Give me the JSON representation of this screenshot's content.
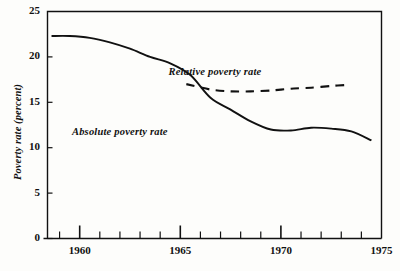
{
  "chart_data": {
    "type": "line",
    "title": "",
    "xlabel": "",
    "ylabel": "Poverty rate (percent)",
    "xlim": [
      1958.4,
      1975.0
    ],
    "ylim": [
      0,
      25
    ],
    "grid": false,
    "legend_position": "inline-annotations",
    "y_ticks": [
      "0",
      "5",
      "10",
      "15",
      "20",
      "25"
    ],
    "y_tick_values": [
      0,
      5,
      10,
      15,
      20,
      25
    ],
    "x_ticks": [
      "1960",
      "1965",
      "1970",
      "1975"
    ],
    "x_tick_values": [
      1960,
      1965,
      1970,
      1975
    ],
    "x_minor_tick_values": [
      1959,
      1960,
      1961,
      1962,
      1963,
      1964,
      1965,
      1966,
      1967,
      1968,
      1969,
      1970,
      1971,
      1972,
      1973,
      1974
    ],
    "series": [
      {
        "name": "Absolute poverty rate",
        "style": "solid",
        "color": "#111111",
        "x": [
          1958.6,
          1959.5,
          1960.5,
          1961.5,
          1962.5,
          1963.5,
          1964.5,
          1965.5,
          1966.5,
          1967.5,
          1968.5,
          1969.5,
          1970.5,
          1971.5,
          1972.5,
          1973.5,
          1974.5
        ],
        "values": [
          22.3,
          22.3,
          22.1,
          21.6,
          20.9,
          20.0,
          19.3,
          18.0,
          15.5,
          14.2,
          12.9,
          12.0,
          11.9,
          12.2,
          12.1,
          11.8,
          10.8
        ]
      },
      {
        "name": "Relative poverty rate",
        "style": "dashed",
        "color": "#111111",
        "x": [
          1965.3,
          1966.5,
          1967.5,
          1968.5,
          1969.5,
          1970.5,
          1971.5,
          1972.5,
          1973.2
        ],
        "values": [
          17.0,
          16.4,
          16.2,
          16.2,
          16.3,
          16.5,
          16.6,
          16.8,
          16.9
        ]
      }
    ],
    "annotations": [
      {
        "text": "Relative poverty rate",
        "x": 1967.0,
        "y": 18.2
      },
      {
        "text": "Absolute poverty rate",
        "x": 1962.2,
        "y": 11.6
      }
    ],
    "final_segment": {
      "name": "Absolute poverty rate tail",
      "x": [
        1974.5
      ],
      "values": [
        11.1
      ]
    }
  }
}
